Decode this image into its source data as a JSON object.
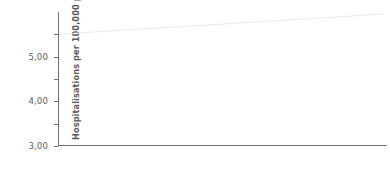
{
  "chart_data": {
    "type": "bar",
    "title": "",
    "subtitle": "",
    "xlabel": "",
    "ylabel": "Hospitalisations per 100,000 population",
    "categories": [
      "Males",
      "Females"
    ],
    "series": [
      {
        "name": "Indigenous",
        "color": "#9a9a9a",
        "values": [
          4.32,
          5.1
        ]
      },
      {
        "name": "Other",
        "color": "#7e7e7e",
        "values": [
          1.22,
          0.72
        ]
      }
    ],
    "ylim": [
      0,
      6.0
    ],
    "ytick_values": [
      0,
      1,
      2,
      3,
      4,
      5
    ],
    "ytick_labels": [
      "0",
      "1,00",
      "2,00",
      "3,00",
      "4,00",
      "5,00"
    ],
    "grid": false,
    "legend_position": "bottom",
    "decimal_separator": ",",
    "axis_color": "#6e6e6e"
  },
  "axis": {
    "y_title": "Hospitalisations per 100,000 population",
    "ticks": [
      {
        "label": "5,00",
        "value": 5
      },
      {
        "label": "4,00",
        "value": 4
      },
      {
        "label": "3,00",
        "value": 3
      },
      {
        "label": "2,00",
        "value": 2
      },
      {
        "label": "1,00",
        "value": 1
      },
      {
        "label": "0",
        "value": 0
      }
    ]
  },
  "categories": [
    {
      "label": "Males"
    },
    {
      "label": "Females"
    }
  ],
  "legend": {
    "items": [
      {
        "label": "Indigenous",
        "color": "#9a9a9a"
      },
      {
        "label": "Other",
        "color": "#7e7e7e"
      }
    ]
  }
}
